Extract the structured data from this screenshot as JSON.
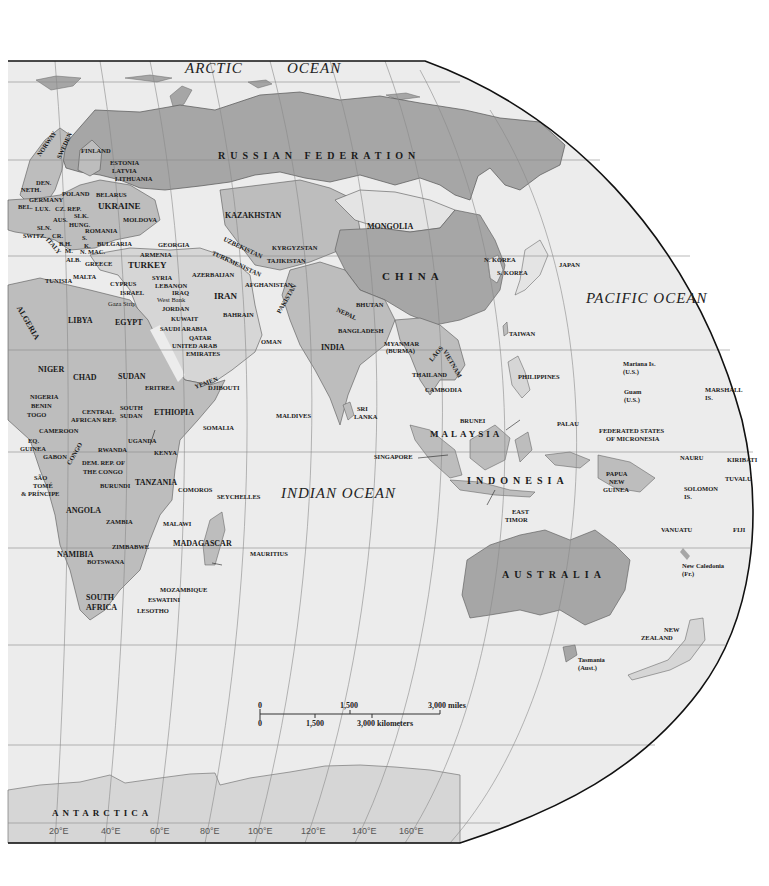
{
  "map": {
    "colors": {
      "ocean": "#ececec",
      "land_dark": "#a6a6a6",
      "land_mid": "#bdbdbd",
      "land_light": "#d6d6d6",
      "land_pale": "#e4e4e4",
      "border": "#555555",
      "graticule": "#8a8a8a",
      "frame": "#111111"
    },
    "oceans": {
      "arctic_1": "ARCTIC",
      "arctic_2": "OCEAN",
      "indian": "INDIAN  OCEAN",
      "pacific": "PACIFIC  OCEAN"
    },
    "major_regions": {
      "russia": "RUSSIAN FEDERATION",
      "china": "CHINA",
      "australia": "AUSTRALIA",
      "indonesia": "INDONESIA",
      "malaysia": "MALAYSIA",
      "antarctica": "ANTARCTICA"
    },
    "europe": {
      "norway": "NORWAY",
      "sweden": "SWEDEN",
      "finland": "FINLAND",
      "estonia": "ESTONIA",
      "latvia": "LATVIA",
      "lithuania": "LITHUANIA",
      "den": "DEN.",
      "neth": "NETH.",
      "germany": "GERMANY",
      "bel": "BEL.",
      "lux": "LUX.",
      "cz_rep": "CZ. REP.",
      "poland": "POLAND",
      "belarus": "BELARUS",
      "ukraine": "UKRAINE",
      "moldova": "MOLDOVA",
      "slk": "SLK.",
      "aus": "AUS.",
      "hung": "HUNG.",
      "romania": "ROMANIA",
      "sln": "SLN.",
      "switz": "SWITZ.",
      "cr": "CR.",
      "bh": "B.H.",
      "s": "S.",
      "k": "K.",
      "m": "M.",
      "n_mac": "N. MAC.",
      "italy": "ITALY",
      "bulgaria": "BULGARIA",
      "alb": "ALB.",
      "greece": "GREECE",
      "malta": "MALTA"
    },
    "middle_east": {
      "georgia": "GEORGIA",
      "armenia": "ARMENIA",
      "azerbaijan": "AZERBAIJAN",
      "turkey": "TURKEY",
      "cyprus": "CYPRUS",
      "syria": "SYRIA",
      "lebanon": "LEBANON",
      "israel": "ISRAEL",
      "iraq": "IRAQ",
      "west_bank": "West Bank",
      "gaza": "Gaza Strip",
      "jordan": "JORDAN",
      "kuwait": "KUWAIT",
      "iran": "IRAN",
      "bahrain": "BAHRAIN",
      "saudi": "SAUDI ARABIA",
      "qatar": "QATAR",
      "uae_1": "UNITED ARAB",
      "uae_2": "EMIRATES",
      "oman": "OMAN",
      "yemen": "YEMEN"
    },
    "asia": {
      "kazakhstan": "KAZAKHSTAN",
      "mongolia": "MONGOLIA",
      "uzbekistan": "UZBEKISTAN",
      "kyrgyzstan": "KYRGYZSTAN",
      "turkmenistan": "TURKMENISTAN",
      "tajikistan": "TAJIKISTAN",
      "afghanistan": "AFGHANISTAN",
      "pakistan": "PAKISTAN",
      "nepal": "NEPAL",
      "bhutan": "BHUTAN",
      "india": "INDIA",
      "bangladesh": "BANGLADESH",
      "myanmar_1": "MYANMAR",
      "myanmar_2": "(BURMA)",
      "laos": "LAOS",
      "vietnam": "VIETNAM",
      "thailand": "THAILAND",
      "cambodia": "CAMBODIA",
      "n_korea": "N. KOREA",
      "s_korea": "S. KOREA",
      "japan": "JAPAN",
      "taiwan": "TAIWAN",
      "philippines": "PHILIPPINES",
      "brunei": "BRUNEI",
      "singapore": "SINGAPORE",
      "maldives": "MALDIVES",
      "sri_lanka_1": "SRI",
      "sri_lanka_2": "LANKA",
      "east_timor_1": "EAST",
      "east_timor_2": "TIMOR"
    },
    "africa": {
      "tunisia": "TUNISIA",
      "algeria": "ALGERIA",
      "libya": "LIBYA",
      "egypt": "EGYPT",
      "niger": "NIGER",
      "chad": "CHAD",
      "sudan": "SUDAN",
      "eritrea": "ERITREA",
      "djibouti": "DJIBOUTI",
      "nigeria": "NIGERIA",
      "benin": "BENIN",
      "togo": "TOGO",
      "car_1": "CENTRAL",
      "car_2": "AFRICAN REP.",
      "s_sudan_1": "SOUTH",
      "s_sudan_2": "SUDAN",
      "ethiopia": "ETHIOPIA",
      "somalia": "SOMALIA",
      "cameroon": "CAMEROON",
      "eq_guinea_1": "EQ.",
      "eq_guinea_2": "GUINEA",
      "gabon": "GABON",
      "congo": "CONGO",
      "sao_tome_1": "SÃO",
      "sao_tome_2": "TOMÉ",
      "sao_tome_3": "& PRÍNCIPE",
      "rwanda": "RWANDA",
      "uganda": "UGANDA",
      "kenya": "KENYA",
      "drc_1": "DEM. REP. OF",
      "drc_2": "THE CONGO",
      "burundi": "BURUNDI",
      "tanzania": "TANZANIA",
      "comoros": "COMOROS",
      "seychelles": "SEYCHELLES",
      "angola": "ANGOLA",
      "zambia": "ZAMBIA",
      "malawi": "MALAWI",
      "madagascar": "MADAGASCAR",
      "mauritius": "MAURITIUS",
      "zimbabwe": "ZIMBABWE",
      "namibia": "NAMIBIA",
      "botswana": "BOTSWANA",
      "mozambique": "MOZAMBIQUE",
      "eswatini": "ESWATINI",
      "south_africa_1": "SOUTH",
      "south_africa_2": "AFRICA",
      "lesotho": "LESOTHO"
    },
    "oceania": {
      "palau": "PALAU",
      "mariana_1": "Mariana Is.",
      "mariana_2": "(U.S.)",
      "guam_1": "Guam",
      "guam_2": "(U.S.)",
      "marshall_1": "MARSHALL",
      "marshall_2": "IS.",
      "micronesia_1": "FEDERATED STATES",
      "micronesia_2": "OF MICRONESIA",
      "nauru": "NAURU",
      "kiribati": "KIRIBATI",
      "tuvalu": "TUVALU",
      "png_1": "PAPUA",
      "png_2": "NEW",
      "png_3": "GUINEA",
      "solomon_1": "SOLOMON",
      "solomon_2": "IS.",
      "vanuatu": "VANUATU",
      "fiji": "FIJI",
      "new_caledonia_1": "New Caledonia",
      "new_caledonia_2": "(Fr.)",
      "new_zealand_1": "NEW",
      "new_zealand_2": "ZEALAND",
      "tasmania_1": "Tasmania",
      "tasmania_2": "(Aust.)"
    },
    "scale_bar": {
      "miles_0": "0",
      "miles_mid": "1,500",
      "miles_end": "3,000 miles",
      "km_0": "0",
      "km_mid": "1,500",
      "km_end": "3,000 kilometers"
    },
    "longitude_ticks": [
      "20°E",
      "40°E",
      "60°E",
      "80°E",
      "100°E",
      "120°E",
      "140°E",
      "160°E"
    ]
  }
}
